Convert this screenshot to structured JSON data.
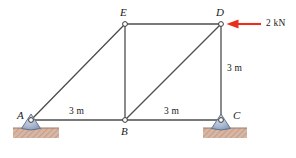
{
  "figure": {
    "type": "truss-free-body-diagram",
    "background_color": "#ffffff",
    "member_color": "#4d4d4d",
    "node_fill_color": "#ffffff",
    "node_stroke_color": "#3a3a3a",
    "support_fill_color": "#aebcd4",
    "support_stroke_color": "#5a6c86",
    "ground_fill_color": "#d8b6a4",
    "ground_hatch_color": "#b08b78",
    "load_color": "#e8301c"
  },
  "nodes": [
    {
      "id": "A",
      "label": "A",
      "x": 31,
      "y": 120,
      "label_x": 17,
      "label_y": 110
    },
    {
      "id": "B",
      "label": "B",
      "x": 125,
      "y": 120,
      "label_x": 121,
      "label_y": 126
    },
    {
      "id": "C",
      "label": "C",
      "x": 221,
      "y": 120,
      "label_x": 233,
      "label_y": 110
    },
    {
      "id": "D",
      "label": "D",
      "x": 221,
      "y": 24,
      "label_x": 216,
      "label_y": 7
    },
    {
      "id": "E",
      "label": "E",
      "x": 125,
      "y": 24,
      "label_x": 120,
      "label_y": 7
    }
  ],
  "members": [
    {
      "from": "A",
      "to": "B"
    },
    {
      "from": "B",
      "to": "C"
    },
    {
      "from": "A",
      "to": "E"
    },
    {
      "from": "E",
      "to": "B"
    },
    {
      "from": "E",
      "to": "D"
    },
    {
      "from": "B",
      "to": "D"
    },
    {
      "from": "D",
      "to": "C"
    }
  ],
  "supports": [
    {
      "id": "support-A",
      "node": "A",
      "kind": "pin",
      "x": 31,
      "y": 120
    },
    {
      "id": "support-C",
      "node": "C",
      "kind": "pin",
      "x": 221,
      "y": 120
    }
  ],
  "dimensions": [
    {
      "id": "dim-AB",
      "text": "3 m",
      "x": 69,
      "y": 109
    },
    {
      "id": "dim-BC",
      "text": "3 m",
      "x": 164,
      "y": 109
    },
    {
      "id": "dim-DC",
      "text": "3 m",
      "x": 227,
      "y": 67
    }
  ],
  "load": {
    "id": "load-D",
    "text": "2 kN",
    "magnitude": 2,
    "unit": "kN",
    "direction": "left",
    "applied_at": "D",
    "arrow_tip_x": 227,
    "arrow_tail_x": 261,
    "arrow_y": 24,
    "label_x": 266,
    "label_y": 18
  }
}
